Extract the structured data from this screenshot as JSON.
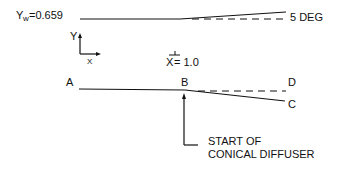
{
  "diagram": {
    "top_wall": {
      "label_prefix": "Y",
      "label_subscript": "w",
      "label_value": "=0.659",
      "angle_label": "5 DEG"
    },
    "axes": {
      "y_label": "Y",
      "x_label": "X"
    },
    "station": {
      "label": "X",
      "value": "= 1.0"
    },
    "points": {
      "A": "A",
      "B": "B",
      "C": "C",
      "D": "D"
    },
    "annotation": {
      "line1": "START OF",
      "line2": "CONICAL DIFFUSER"
    },
    "colors": {
      "ink": "#111111",
      "background": "#ffffff"
    }
  }
}
